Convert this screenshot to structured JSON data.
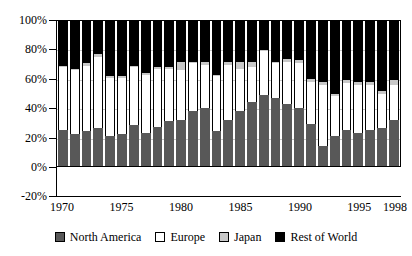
{
  "chart_data": {
    "type": "bar",
    "stacked": true,
    "title": "",
    "subtitle": "",
    "xlabel": "",
    "ylabel": "",
    "ylim": [
      -20,
      100
    ],
    "yticks": [
      "-20%",
      "0%",
      "20%",
      "40%",
      "60%",
      "80%",
      "100%"
    ],
    "ytick_values": [
      -20,
      0,
      20,
      40,
      60,
      80,
      100
    ],
    "grid": true,
    "legend_position": "bottom",
    "categories": [
      "1970",
      "1971",
      "1972",
      "1973",
      "1974",
      "1975",
      "1976",
      "1977",
      "1978",
      "1979",
      "1980",
      "1981",
      "1982",
      "1983",
      "1984",
      "1985",
      "1986",
      "1987",
      "1988",
      "1989",
      "1990",
      "1991",
      "1992",
      "1993",
      "1994",
      "1995",
      "1996",
      "1997",
      "1998"
    ],
    "xtick_labels": [
      "1970",
      "1975",
      "1980",
      "1985",
      "1990",
      "1995",
      "1998"
    ],
    "xtick_categories": [
      "1970",
      "1975",
      "1980",
      "1985",
      "1990",
      "1995",
      "1998"
    ],
    "series": [
      {
        "name": "North America",
        "color": "#585858",
        "values": [
          25,
          22,
          24,
          26,
          21,
          22,
          28,
          23,
          27,
          31,
          32,
          38,
          40,
          24,
          32,
          38,
          44,
          49,
          47,
          43,
          40,
          29,
          14,
          21,
          25,
          23,
          25,
          26,
          32
        ]
      },
      {
        "name": "Europe",
        "color": "#ffffff",
        "values": [
          43,
          44,
          45,
          49,
          40,
          39,
          40,
          40,
          40,
          36,
          34,
          33,
          30,
          38,
          38,
          29,
          24,
          30,
          24,
          29,
          31,
          29,
          42,
          27,
          32,
          33,
          31,
          24,
          24
        ]
      },
      {
        "name": "Japan",
        "color": "#c8c8c8",
        "values": [
          1,
          1,
          2,
          2,
          1,
          1,
          1,
          1,
          1,
          1,
          6,
          1,
          2,
          1,
          2,
          5,
          4,
          1,
          1,
          2,
          2,
          2,
          2,
          2,
          2,
          2,
          2,
          2,
          3
        ]
      },
      {
        "name": "Rest of World",
        "color": "#000000",
        "values": [
          31,
          33,
          29,
          23,
          38,
          38,
          31,
          36,
          32,
          32,
          28,
          28,
          28,
          37,
          28,
          28,
          28,
          20,
          28,
          26,
          27,
          40,
          42,
          50,
          41,
          42,
          42,
          48,
          41
        ]
      }
    ]
  },
  "legend": {
    "items": [
      {
        "label": "North America",
        "swatch": "nam"
      },
      {
        "label": "Europe",
        "swatch": "eur"
      },
      {
        "label": "Japan",
        "swatch": "jpn"
      },
      {
        "label": "Rest of World",
        "swatch": "row"
      }
    ]
  },
  "colors": {
    "north_america": "#585858",
    "europe": "#ffffff",
    "japan": "#c8c8c8",
    "rest_of_world": "#000000",
    "axis": "#000000",
    "grid": "#9a9a9a"
  }
}
